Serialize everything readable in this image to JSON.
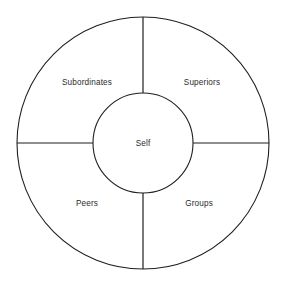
{
  "diagram": {
    "type": "concentric-circle-quadrant",
    "background_color": "#ffffff",
    "line_color": "#1f1f1f",
    "text_color": "#2b2b2b",
    "geometry": {
      "center_x": 143,
      "center_y": 143,
      "outer_radius": 126,
      "inner_radius": 50,
      "spoke_angles_deg": [
        0,
        90,
        180,
        270
      ]
    },
    "center": {
      "label": "Self",
      "x": 143,
      "y": 143
    },
    "sectors": [
      {
        "id": "subordinates",
        "label": "Subordinates",
        "position": "upper-left",
        "x": 87,
        "y": 82
      },
      {
        "id": "superiors",
        "label": "Superiors",
        "position": "upper-right",
        "x": 202,
        "y": 82
      },
      {
        "id": "peers",
        "label": "Peers",
        "position": "lower-left",
        "x": 87,
        "y": 203
      },
      {
        "id": "groups",
        "label": "Groups",
        "position": "lower-right",
        "x": 199,
        "y": 203
      }
    ]
  }
}
